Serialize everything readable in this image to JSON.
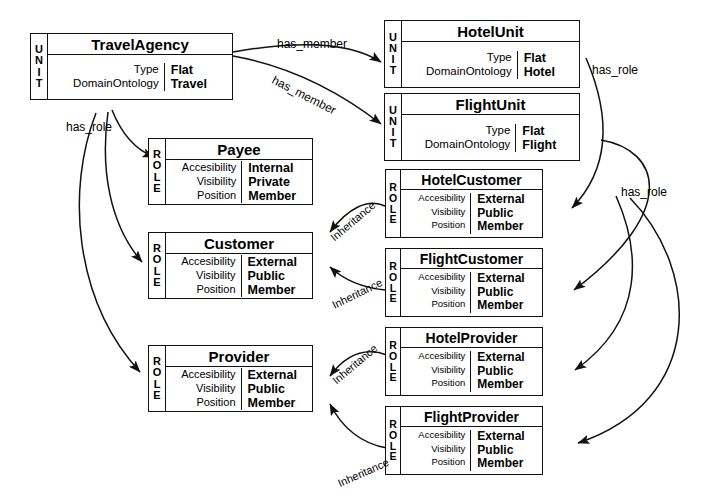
{
  "diagram": {
    "stereotypes": {
      "unit": "UNIT",
      "role": "ROLE"
    },
    "attribute_keys": {
      "type": "Type",
      "domain_ontology": "DomainOntology",
      "accessibility": "Accesibility",
      "visibility": "Visibility",
      "position": "Position"
    }
  },
  "nodes": [
    {
      "id": "travelagency",
      "name": "TravelAgency",
      "stereotype": "UNIT",
      "kind": "unit",
      "attributes": [
        {
          "key": "Type",
          "value": "Flat"
        },
        {
          "key": "DomainOntology",
          "value": "Travel"
        }
      ]
    },
    {
      "id": "hotelunit",
      "name": "HotelUnit",
      "stereotype": "UNIT",
      "kind": "unit",
      "attributes": [
        {
          "key": "Type",
          "value": "Flat"
        },
        {
          "key": "DomainOntology",
          "value": "Hotel"
        }
      ]
    },
    {
      "id": "flightunit",
      "name": "FlightUnit",
      "stereotype": "UNIT",
      "kind": "unit",
      "attributes": [
        {
          "key": "Type",
          "value": "Flat"
        },
        {
          "key": "DomainOntology",
          "value": "Flight"
        }
      ]
    },
    {
      "id": "payee",
      "name": "Payee",
      "stereotype": "ROLE",
      "kind": "role",
      "attributes": [
        {
          "key": "Accesibility",
          "value": "Internal"
        },
        {
          "key": "Visibility",
          "value": "Private"
        },
        {
          "key": "Position",
          "value": "Member"
        }
      ]
    },
    {
      "id": "customer",
      "name": "Customer",
      "stereotype": "ROLE",
      "kind": "role",
      "attributes": [
        {
          "key": "Accesibility",
          "value": "External"
        },
        {
          "key": "Visibility",
          "value": "Public"
        },
        {
          "key": "Position",
          "value": "Member"
        }
      ]
    },
    {
      "id": "provider",
      "name": "Provider",
      "stereotype": "ROLE",
      "kind": "role",
      "attributes": [
        {
          "key": "Accesibility",
          "value": "External"
        },
        {
          "key": "Visibility",
          "value": "Public"
        },
        {
          "key": "Position",
          "value": "Member"
        }
      ]
    },
    {
      "id": "hotelcustomer",
      "name": "HotelCustomer",
      "stereotype": "ROLE",
      "kind": "role",
      "attributes": [
        {
          "key": "Accesibility",
          "value": "External"
        },
        {
          "key": "Visibility",
          "value": "Public"
        },
        {
          "key": "Position",
          "value": "Member"
        }
      ]
    },
    {
      "id": "flightcustomer",
      "name": "FlightCustomer",
      "stereotype": "ROLE",
      "kind": "role",
      "attributes": [
        {
          "key": "Accesibility",
          "value": "External"
        },
        {
          "key": "Visibility",
          "value": "Public"
        },
        {
          "key": "Position",
          "value": "Member"
        }
      ]
    },
    {
      "id": "hotelprovider",
      "name": "HotelProvider",
      "stereotype": "ROLE",
      "kind": "role",
      "attributes": [
        {
          "key": "Accesibility",
          "value": "External"
        },
        {
          "key": "Visibility",
          "value": "Public"
        },
        {
          "key": "Position",
          "value": "Member"
        }
      ]
    },
    {
      "id": "flightprovider",
      "name": "FlightProvider",
      "stereotype": "ROLE",
      "kind": "role",
      "attributes": [
        {
          "key": "Accesibility",
          "value": "External"
        },
        {
          "key": "Visibility",
          "value": "Public"
        },
        {
          "key": "Position",
          "value": "Member"
        }
      ]
    }
  ],
  "edges": [
    {
      "id": "e1",
      "label": "has_member",
      "from": "travelagency",
      "to": "hotelunit"
    },
    {
      "id": "e2",
      "label": "has_member",
      "from": "travelagency",
      "to": "flightunit"
    },
    {
      "id": "e3",
      "label": "has_role",
      "from": "travelagency",
      "to": "payee"
    },
    {
      "id": "e4",
      "label": "has_role",
      "from": "travelagency",
      "to": "customer"
    },
    {
      "id": "e5",
      "label": "has_role",
      "from": "travelagency",
      "to": "provider"
    },
    {
      "id": "e6",
      "label": "has_role",
      "from": "hotelunit",
      "to": "hotelcustomer"
    },
    {
      "id": "e7",
      "label": "has_role",
      "from": "hotelunit",
      "to": "hotelprovider"
    },
    {
      "id": "e8",
      "label": "has_role",
      "from": "flightunit",
      "to": "flightcustomer"
    },
    {
      "id": "e9",
      "label": "has_role",
      "from": "flightunit",
      "to": "flightprovider"
    },
    {
      "id": "e10",
      "label": "Inheritance",
      "from": "hotelcustomer",
      "to": "customer"
    },
    {
      "id": "e11",
      "label": "Inheritance",
      "from": "flightcustomer",
      "to": "customer"
    },
    {
      "id": "e12",
      "label": "Inheritance",
      "from": "hotelprovider",
      "to": "provider"
    },
    {
      "id": "e13",
      "label": "Inheritance",
      "from": "flightprovider",
      "to": "provider"
    }
  ],
  "edge_labels": {
    "has_member_1": "has_member",
    "has_member_2": "has_member",
    "has_role_left": "has_role",
    "has_role_right_top": "has_role",
    "has_role_right_bottom": "has_role",
    "inheritance_1": "Inheritance",
    "inheritance_2": "Inheritance",
    "inheritance_3": "Inheritance",
    "inheritance_4": "Inheritance"
  }
}
